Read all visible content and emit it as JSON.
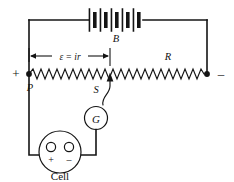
{
  "diagram": {
    "labels": {
      "battery": "B",
      "resistor": "R",
      "potentiometer_left_terminal": "P",
      "slider": "S",
      "galvanometer": "G",
      "cell": "Cell",
      "emf_expression": "ε = ir",
      "plus_terminal": "+",
      "minus_terminal": "–",
      "cell_plus": "+",
      "cell_minus": "–"
    },
    "colors": {
      "line": "#141414",
      "background": "#ffffff",
      "fill": "#ffffff"
    },
    "components": [
      {
        "name": "battery",
        "symbol": "multi-cell-battery",
        "label": "B",
        "cells": 4
      },
      {
        "name": "potentiometer-wire",
        "symbol": "resistor-zigzag",
        "label": "R"
      },
      {
        "name": "sliding-contact",
        "symbol": "arrow-tap",
        "label": "S"
      },
      {
        "name": "galvanometer",
        "symbol": "circle-G",
        "label": "G"
      },
      {
        "name": "cell",
        "symbol": "round-cell-two-terminals",
        "label": "Cell"
      }
    ],
    "annotations": [
      {
        "name": "emf-dimension",
        "text": "ε = ir",
        "arrow": "double-headed"
      }
    ]
  }
}
